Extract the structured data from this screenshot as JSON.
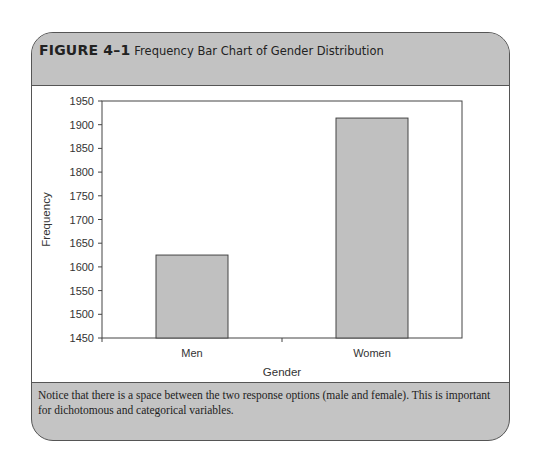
{
  "figure": {
    "label": "FIGURE 4–1",
    "title": "Frequency Bar Chart of Gender Distribution",
    "caption": "Notice that there is a space between the two response options (male and female). This is important for dichotomous and categorical variables."
  },
  "colors": {
    "frame_gray": "#c4c4c4",
    "bar_fill": "#c0c0c0",
    "bar_stroke": "#444444",
    "axis": "#444444"
  },
  "chart_data": {
    "type": "bar",
    "title": "Frequency Bar Chart of Gender Distribution",
    "categories": [
      "Men",
      "Women"
    ],
    "values": [
      1625,
      1914
    ],
    "xlabel": "Gender",
    "ylabel": "Frequency",
    "ylim": [
      1450,
      1950
    ],
    "yticks": [
      1450,
      1500,
      1550,
      1600,
      1650,
      1700,
      1750,
      1800,
      1850,
      1900,
      1950
    ],
    "grid": false,
    "legend": null
  }
}
